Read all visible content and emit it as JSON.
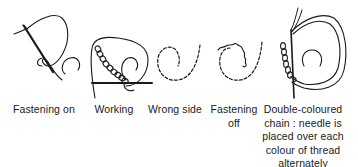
{
  "figure": {
    "stroke_color": "#1a1a1a",
    "background": "#ffffff"
  },
  "panels": [
    {
      "id": "fastening-on",
      "caption_lines": [
        "Fastening on"
      ]
    },
    {
      "id": "working",
      "caption_lines": [
        "Working"
      ]
    },
    {
      "id": "wrong-side",
      "caption_lines": [
        "Wrong side"
      ]
    },
    {
      "id": "fastening-off",
      "caption_lines": [
        "Fastening",
        "off"
      ]
    },
    {
      "id": "double-coloured",
      "caption_lines": [
        "Double-coloured",
        "chain : needle is",
        "placed over each",
        "colour of thread",
        "alternately"
      ]
    }
  ]
}
